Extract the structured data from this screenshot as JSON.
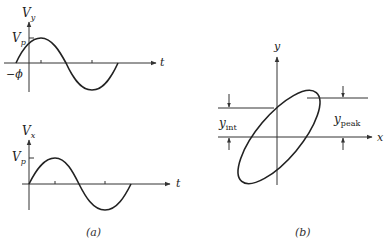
{
  "panel_a": {
    "caption": "(a)",
    "top_plot": {
      "y_label": "V",
      "y_label_sub": "y",
      "x_label": "t",
      "peak_label": "V",
      "peak_label_sub": "p",
      "phase_label": "−ϕ"
    },
    "bottom_plot": {
      "y_label": "V",
      "y_label_sub": "x",
      "x_label": "t",
      "peak_label": "V",
      "peak_label_sub": "p"
    }
  },
  "panel_b": {
    "caption": "(b)",
    "y_axis_label": "y",
    "x_axis_label": "x",
    "intercept_label": "y",
    "intercept_label_sub": "int",
    "peak_label": "y",
    "peak_label_sub": "peak"
  },
  "colors": {
    "ink": "#222222",
    "background": "#ffffff"
  }
}
